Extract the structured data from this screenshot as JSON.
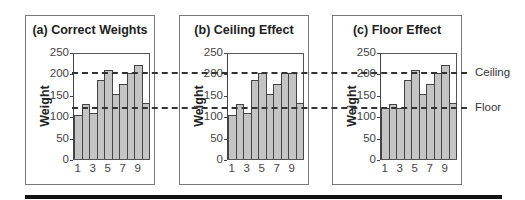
{
  "chart_data": [
    {
      "type": "bar",
      "title": "(a) Correct Weights",
      "xlabel": "",
      "ylabel": "Weight",
      "ylim": [
        0,
        250
      ],
      "yticks": [
        0,
        50,
        100,
        150,
        200,
        250
      ],
      "xtick_labels": [
        "1",
        "3",
        "5",
        "7",
        "9"
      ],
      "categories": [
        1,
        2,
        3,
        4,
        5,
        6,
        7,
        8,
        9,
        10
      ],
      "values": [
        103,
        128,
        108,
        185,
        208,
        152,
        175,
        200,
        219,
        132
      ]
    },
    {
      "type": "bar",
      "title": "(b)  Ceiling Effect",
      "xlabel": "",
      "ylabel": "Weight",
      "ylim": [
        0,
        250
      ],
      "yticks": [
        0,
        50,
        100,
        150,
        200,
        250
      ],
      "xtick_labels": [
        "1",
        "3",
        "5",
        "7",
        "9"
      ],
      "categories": [
        1,
        2,
        3,
        4,
        5,
        6,
        7,
        8,
        9,
        10
      ],
      "values": [
        103,
        128,
        108,
        185,
        200,
        152,
        175,
        200,
        200,
        132
      ]
    },
    {
      "type": "bar",
      "title": "(c) Floor Effect",
      "xlabel": "",
      "ylabel": "Weight",
      "ylim": [
        0,
        250
      ],
      "yticks": [
        0,
        50,
        100,
        150,
        200,
        250
      ],
      "xtick_labels": [
        "1",
        "3",
        "5",
        "7",
        "9"
      ],
      "categories": [
        1,
        2,
        3,
        4,
        5,
        6,
        7,
        8,
        9,
        10
      ],
      "values": [
        120,
        128,
        120,
        185,
        208,
        152,
        175,
        200,
        219,
        132
      ]
    }
  ],
  "reference_lines": [
    {
      "label": "Ceiling",
      "value": 200
    },
    {
      "label": "Floor",
      "value": 120
    }
  ],
  "colors": {
    "bar_fill": "#c4c4c4",
    "bar_edge": "#444444",
    "rule": "#111111"
  }
}
